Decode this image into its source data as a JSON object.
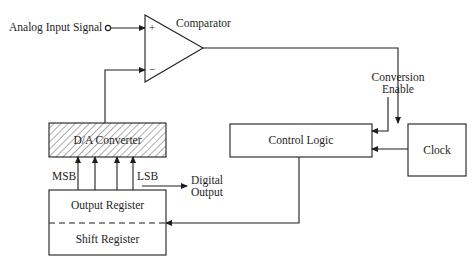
{
  "diagram": {
    "type": "block-diagram",
    "inputs": {
      "analog_input": "Analog Input Signal",
      "conversion_enable_line1": "Conversion",
      "conversion_enable_line2": "Enable"
    },
    "blocks": {
      "comparator": "Comparator",
      "comparator_plus": "+",
      "comparator_minus": "−",
      "dac": "D/A Converter",
      "control_logic": "Control Logic",
      "clock": "Clock",
      "output_register": "Output Register",
      "shift_register": "Shift Register"
    },
    "bit_labels": {
      "msb": "MSB",
      "lsb": "LSB"
    },
    "outputs": {
      "digital_output_line1": "Digital",
      "digital_output_line2": "Output"
    },
    "colors": {
      "line": "#1e1e1e",
      "background": "#ffffff"
    }
  }
}
